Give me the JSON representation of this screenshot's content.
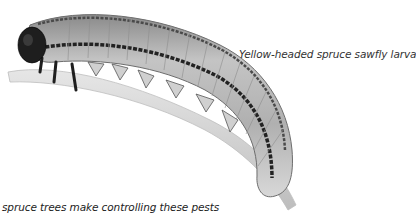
{
  "figure": {
    "caption": "Yellow-headed spruce sawfly larva",
    "colors": {
      "background": "#ffffff",
      "body_light": "#c9c9c9",
      "body_mid": "#9a9a9a",
      "stripe_dark": "#2e2e2e",
      "head": "#1e1e1e",
      "twig": "#d6d6d6",
      "caption_text": "#333333"
    }
  },
  "text": {
    "truncated_line": "spruce trees make controlling these pests"
  }
}
